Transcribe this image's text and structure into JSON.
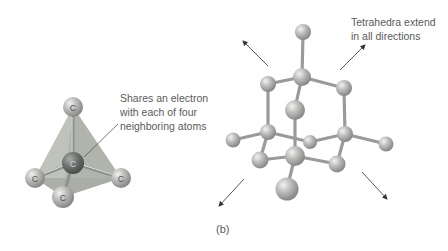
{
  "figure": {
    "panel_label": "(b)",
    "left_diagram": {
      "title": "carbon-tetrahedron",
      "atom_symbol": "C",
      "atoms": [
        {
          "role": "top",
          "symbol": "C"
        },
        {
          "role": "center",
          "symbol": "C"
        },
        {
          "role": "left",
          "symbol": "C"
        },
        {
          "role": "right",
          "symbol": "C"
        },
        {
          "role": "bottom",
          "symbol": "C"
        }
      ],
      "annotation": {
        "lines": [
          "Shares an electron",
          "with each of four",
          "neighboring atoms"
        ]
      }
    },
    "right_diagram": {
      "title": "diamond-lattice",
      "annotation": {
        "lines": [
          "Tetrahedra extend",
          "in all directions"
        ]
      },
      "arrow_count": 4
    },
    "colors": {
      "atom_light": "#b4b5b3",
      "atom_dark": "#6b6f6c",
      "bond": "#9a9b99",
      "tetra_face_light": "#c9cbc6",
      "tetra_face_dark": "#a9ada7",
      "arrow": "#444444",
      "text": "#5a5a5a"
    }
  }
}
